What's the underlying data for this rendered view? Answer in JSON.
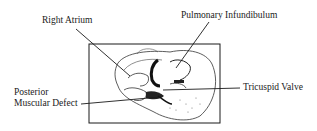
{
  "figure": {
    "labels": {
      "right_atrium": "Right Atrium",
      "pulmonary_infundibulum": "Pulmonary Infundibulum",
      "posterior_muscular_defect_line1": "Posterior",
      "posterior_muscular_defect_line2": "Muscular Defect",
      "tricuspid_valve": "Tricuspid Valve"
    }
  }
}
